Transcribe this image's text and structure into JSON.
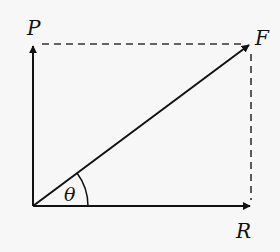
{
  "diagram": {
    "labels": {
      "P": "P",
      "F": "F",
      "R": "R",
      "theta": "θ"
    },
    "geometry": {
      "origin": [
        33,
        206
      ],
      "P_tip": [
        33,
        44
      ],
      "F_tip": [
        250,
        44
      ],
      "R_tip": [
        251,
        206
      ],
      "angle_arc_radius": 55
    },
    "colors": {
      "background": "#f7f7f7",
      "solid": "#111111",
      "dashed": "#333333"
    }
  }
}
